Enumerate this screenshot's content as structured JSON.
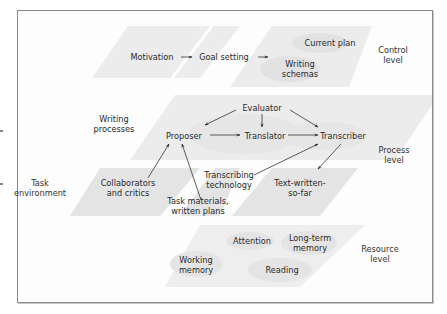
{
  "colors": {
    "frame_border": "#8a8a8a",
    "panel_fill": "#ececec",
    "panel_fill_dark": "#e2e2e2",
    "ellipse_fill": "#e4e4e4",
    "text": "#2a2a2a",
    "arrow": "#333333"
  },
  "levels": {
    "control": "Control\nlevel",
    "process": "Process\nlevel",
    "resource": "Resource\nlevel",
    "task_environment": "Task\nenvironment"
  },
  "control_level": {
    "motivation": "Motivation",
    "goal_setting": "Goal setting",
    "current_plan": "Current plan",
    "writing_schemas": "Writing\nschemas"
  },
  "process_level": {
    "writing_processes": "Writing\nprocesses",
    "evaluator": "Evaluator",
    "proposer": "Proposer",
    "translator": "Translator",
    "transcriber": "Transcriber"
  },
  "task_environment": {
    "collaborators": "Collaborators\nand critics",
    "task_materials": "Task materials,\nwritten plans",
    "transcribing_technology": "Transcribing\ntechnology",
    "text_written": "Text-written-\nso-far"
  },
  "resource_level": {
    "attention": "Attention",
    "long_term_memory": "Long-term\nmemory",
    "working_memory": "Working\nmemory",
    "reading": "Reading"
  },
  "edges": [
    {
      "from": "Motivation",
      "to": "Goal setting"
    },
    {
      "from": "Goal setting",
      "to": "Control plan panel"
    },
    {
      "from": "Evaluator",
      "to": "Proposer"
    },
    {
      "from": "Evaluator",
      "to": "Translator"
    },
    {
      "from": "Evaluator",
      "to": "Transcriber"
    },
    {
      "from": "Proposer",
      "to": "Translator"
    },
    {
      "from": "Translator",
      "to": "Transcriber"
    },
    {
      "from": "Collaborators and critics",
      "to": "Proposer"
    },
    {
      "from": "Task materials, written plans",
      "to": "Proposer"
    },
    {
      "from": "Transcribing technology",
      "to": "Transcriber"
    },
    {
      "from": "Transcriber",
      "to": "Text-written-so-far"
    }
  ]
}
